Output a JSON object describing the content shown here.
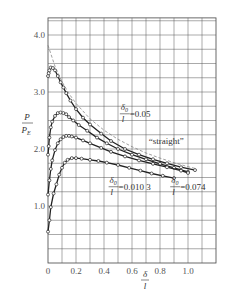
{
  "chart_data": {
    "type": "line",
    "title": "",
    "xlabel": "δ/l",
    "ylabel": "P/P_E",
    "xlim": [
      0,
      1.2
    ],
    "ylim": [
      0,
      4.3
    ],
    "grid": true,
    "x_ticks": [
      {
        "value": 0,
        "label": "0"
      },
      {
        "value": 0.2,
        "label": "0.2"
      },
      {
        "value": 0.4,
        "label": "0.4"
      },
      {
        "value": 0.6,
        "label": "0.6"
      },
      {
        "value": 0.8,
        "label": "0.8"
      },
      {
        "value": 1.0,
        "label": "1.0"
      }
    ],
    "y_ticks": [
      {
        "value": 1.0,
        "label": "1.0"
      },
      {
        "value": 2.0,
        "label": "2.0"
      },
      {
        "value": 3.0,
        "label": "3.0"
      },
      {
        "value": 4.0,
        "label": "4.0"
      }
    ],
    "series": [
      {
        "name": "straight",
        "style": "solid-markers",
        "x": [
          0.0,
          0.005,
          0.01,
          0.02,
          0.035,
          0.05,
          0.07,
          0.09,
          0.11,
          0.13,
          0.16,
          0.2,
          0.25,
          0.3,
          0.38,
          0.45,
          0.55,
          0.65,
          0.75,
          0.85,
          0.95,
          1.05
        ],
        "y": [
          3.28,
          3.33,
          3.38,
          3.43,
          3.42,
          3.38,
          3.28,
          3.17,
          3.08,
          2.98,
          2.85,
          2.7,
          2.55,
          2.43,
          2.27,
          2.14,
          2.0,
          1.9,
          1.82,
          1.75,
          1.68,
          1.63
        ]
      },
      {
        "name": "δ0/l=0.0103",
        "style": "solid-markers",
        "x": [
          0.0,
          0.005,
          0.01,
          0.02,
          0.03,
          0.05,
          0.07,
          0.09,
          0.11,
          0.13,
          0.15,
          0.18,
          0.22,
          0.28,
          0.35,
          0.42,
          0.5,
          0.6,
          0.7,
          0.8,
          0.9,
          1.0
        ],
        "y": [
          1.9,
          2.05,
          2.2,
          2.38,
          2.48,
          2.58,
          2.63,
          2.64,
          2.63,
          2.61,
          2.56,
          2.5,
          2.42,
          2.32,
          2.2,
          2.1,
          2.0,
          1.9,
          1.82,
          1.74,
          1.67,
          1.6
        ]
      },
      {
        "name": "δ0/l=0.05",
        "style": "solid-markers",
        "x": [
          0.0,
          0.01,
          0.02,
          0.03,
          0.05,
          0.07,
          0.09,
          0.11,
          0.13,
          0.15,
          0.17,
          0.2,
          0.25,
          0.3,
          0.38,
          0.45,
          0.55,
          0.65,
          0.75,
          0.85,
          0.95,
          1.0
        ],
        "y": [
          1.2,
          1.45,
          1.65,
          1.8,
          1.98,
          2.1,
          2.17,
          2.21,
          2.23,
          2.23,
          2.22,
          2.2,
          2.15,
          2.1,
          2.02,
          1.95,
          1.87,
          1.8,
          1.74,
          1.68,
          1.62,
          1.58
        ]
      },
      {
        "name": "δ0/l=0.074",
        "style": "solid-markers",
        "x": [
          0.0,
          0.01,
          0.02,
          0.04,
          0.06,
          0.08,
          0.1,
          0.12,
          0.14,
          0.17,
          0.2,
          0.24,
          0.3,
          0.36,
          0.42,
          0.5,
          0.58,
          0.66,
          0.74,
          0.82,
          0.9
        ],
        "y": [
          0.55,
          0.75,
          0.98,
          1.22,
          1.38,
          1.55,
          1.67,
          1.76,
          1.81,
          1.84,
          1.84,
          1.83,
          1.81,
          1.79,
          1.76,
          1.72,
          1.67,
          1.62,
          1.57,
          1.53,
          1.49
        ]
      },
      {
        "name": "Euler-type reference (dashed)",
        "style": "dashed",
        "x": [
          0.0,
          0.05,
          0.1,
          0.15,
          0.2,
          0.3,
          0.4,
          0.5,
          0.6,
          0.7,
          0.8,
          0.9,
          1.0,
          1.05
        ],
        "y": [
          3.82,
          3.45,
          3.18,
          2.97,
          2.8,
          2.53,
          2.33,
          2.17,
          2.04,
          1.93,
          1.84,
          1.76,
          1.69,
          1.66
        ]
      }
    ],
    "annotations": [
      {
        "text_num": "δ",
        "text_sub": "0",
        "text_den": "l",
        "text_value": "=0.05",
        "x": 0.52,
        "y": 2.6
      },
      {
        "text": "“straight”",
        "x": 0.72,
        "y": 2.08
      },
      {
        "text_num": "δ",
        "text_sub": "0",
        "text_den": "l",
        "text_value": "=0.010 3",
        "x": 0.44,
        "y": 1.32
      },
      {
        "text_num": "δ",
        "text_sub": "0",
        "text_den": "l",
        "text_value": "=0.074",
        "x": 0.88,
        "y": 1.32
      }
    ]
  },
  "axis": {
    "y_label_num": "P",
    "y_label_den": "P",
    "y_label_den_sub": "E",
    "x_label_num": "δ",
    "x_label_den": "l"
  }
}
